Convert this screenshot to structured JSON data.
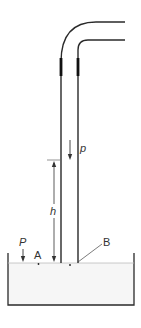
{
  "diagram": {
    "type": "physics-schematic",
    "labels": {
      "flow_density": "p",
      "height": "h",
      "pressure": "P",
      "point_a": "A",
      "point_b": "B"
    },
    "colors": {
      "line": "#2a2a2a",
      "sleeve": "#111111",
      "liquid": "#f4f4f4",
      "background": "#ffffff"
    }
  }
}
